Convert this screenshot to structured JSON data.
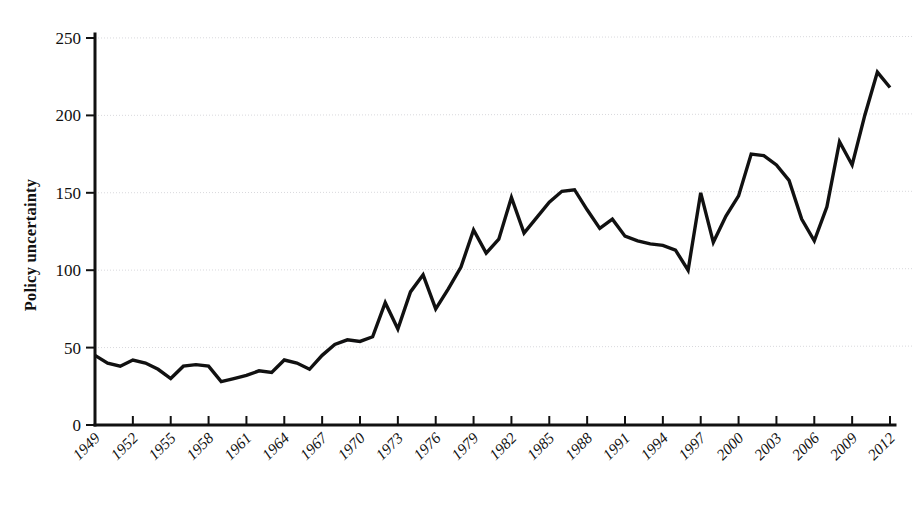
{
  "chart_data": {
    "type": "line",
    "title": "",
    "subtitle": "",
    "xlabel": "",
    "ylabel": "Policy uncertainty",
    "xlim": [
      1949,
      2012
    ],
    "ylim": [
      0,
      250
    ],
    "grid": true,
    "legend": null,
    "y_ticks": [
      0,
      50,
      100,
      150,
      200,
      250
    ],
    "y_tick_labels": [
      "0",
      "50",
      "100",
      "150",
      "200",
      "250"
    ],
    "x_ticks": [
      1949,
      1952,
      1955,
      1958,
      1961,
      1964,
      1967,
      1970,
      1973,
      1976,
      1979,
      1982,
      1985,
      1988,
      1991,
      1994,
      1997,
      2000,
      2003,
      2006,
      2009,
      2012
    ],
    "x_tick_labels": [
      "1949",
      "1952",
      "1955",
      "1958",
      "1961",
      "1964",
      "1967",
      "1970",
      "1973",
      "1976",
      "1979",
      "1982",
      "1985",
      "1988",
      "1991",
      "1994",
      "1997",
      "2000",
      "2003",
      "2006",
      "2009",
      "2012"
    ],
    "line_color": "#111111",
    "grid_color": "#d8d8dc",
    "background_color": "#ffffff",
    "series": [
      {
        "name": "Policy uncertainty",
        "x": [
          1949,
          1950,
          1951,
          1952,
          1953,
          1954,
          1955,
          1956,
          1957,
          1958,
          1959,
          1960,
          1961,
          1962,
          1963,
          1964,
          1965,
          1966,
          1967,
          1968,
          1969,
          1970,
          1971,
          1972,
          1973,
          1974,
          1975,
          1976,
          1977,
          1978,
          1979,
          1980,
          1981,
          1982,
          1983,
          1984,
          1985,
          1986,
          1987,
          1988,
          1989,
          1990,
          1991,
          1992,
          1993,
          1994,
          1995,
          1996,
          1997,
          1998,
          1999,
          2000,
          2001,
          2002,
          2003,
          2004,
          2005,
          2006,
          2007,
          2008,
          2009,
          2010,
          2011,
          2012
        ],
        "values": [
          45,
          40,
          38,
          42,
          40,
          36,
          30,
          38,
          39,
          38,
          28,
          30,
          32,
          35,
          34,
          42,
          40,
          36,
          45,
          52,
          55,
          54,
          57,
          79,
          62,
          86,
          97,
          75,
          88,
          102,
          126,
          111,
          120,
          147,
          124,
          134,
          144,
          151,
          152,
          139,
          127,
          133,
          122,
          119,
          117,
          116,
          113,
          100,
          150,
          118,
          135,
          148,
          175,
          174,
          168,
          158,
          133,
          119,
          141,
          183,
          168,
          200,
          228,
          218
        ]
      }
    ],
    "annotations": []
  },
  "axes": {
    "y_axis_title": "Policy uncertainty"
  }
}
